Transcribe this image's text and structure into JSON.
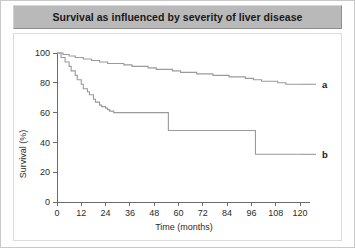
{
  "figure": {
    "title": "Survival as influenced by severity of liver disease",
    "panel_background": "#ffffff",
    "title_bar_color": "#b9b9b9",
    "curve_color": "#9a9a9a",
    "axis_color": "#6b6b6b"
  },
  "chart_data": {
    "type": "line",
    "subtype": "kaplan-meier-step",
    "title": "Survival as influenced by severity of liver disease",
    "xlabel": "Time (months)",
    "ylabel": "Survival (%)",
    "xlim": [
      0,
      120
    ],
    "ylim": [
      0,
      100
    ],
    "xticks": [
      0,
      12,
      24,
      36,
      48,
      60,
      72,
      84,
      96,
      108,
      120
    ],
    "yticks": [
      0,
      20,
      40,
      60,
      80,
      100
    ],
    "xtick_labels": [
      "0",
      "12",
      "24",
      "36",
      "48",
      "60",
      "72",
      "84",
      "96",
      "108",
      "120"
    ],
    "ytick_labels": [
      "0",
      "20",
      "40",
      "60",
      "80",
      "100"
    ],
    "grid": false,
    "legend": "inline-right-labels",
    "series": [
      {
        "name": "a",
        "label": "a",
        "label_x": 120,
        "label_y": 79,
        "color": "#9a9a9a",
        "final_value": 79,
        "x": [
          0,
          3,
          6,
          9,
          13,
          17,
          21,
          25,
          29,
          33,
          37,
          41,
          45,
          49,
          53,
          57,
          61,
          65,
          69,
          73,
          77,
          81,
          85,
          89,
          93,
          97,
          101,
          105,
          109,
          113,
          117,
          120
        ],
        "y": [
          100,
          99,
          98,
          97,
          96,
          95,
          94,
          93,
          93,
          92,
          91,
          91,
          90,
          89,
          89,
          88,
          87,
          87,
          86,
          86,
          85,
          85,
          84,
          84,
          83,
          82,
          81,
          81,
          80,
          79,
          79,
          79
        ]
      },
      {
        "name": "b",
        "label": "b",
        "label_x": 120,
        "label_y": 32,
        "color": "#9a9a9a",
        "final_value": 32,
        "x": [
          0,
          2,
          4,
          6,
          7,
          9,
          10,
          12,
          13,
          15,
          16,
          18,
          19,
          21,
          22,
          24,
          25,
          26,
          28,
          30,
          55,
          98,
          120
        ],
        "y": [
          100,
          97,
          94,
          91,
          88,
          85,
          82,
          79,
          76,
          74,
          72,
          69,
          67,
          65,
          64,
          63,
          62,
          61,
          60,
          60,
          48,
          32,
          32
        ]
      }
    ],
    "annotations": []
  }
}
